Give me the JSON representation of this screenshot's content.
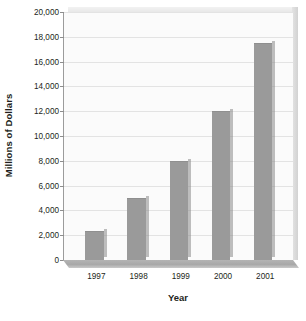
{
  "chart_data": {
    "type": "bar",
    "title": "",
    "subtitle": "",
    "xlabel": "Year",
    "ylabel": "Millions of Dollars",
    "categories": [
      "1997",
      "1998",
      "1999",
      "2000",
      "2001"
    ],
    "values": [
      2300,
      5000,
      8000,
      12000,
      17500
    ],
    "series": [
      {
        "name": "Millions of Dollars",
        "values": [
          2300,
          5000,
          8000,
          12000,
          17500
        ]
      }
    ],
    "ylim": [
      0,
      20000
    ],
    "ytick_step": 2000,
    "ytick_labels": [
      "20,000",
      "18,000",
      "16,000",
      "14,000",
      "12,000",
      "10,000",
      "8,000",
      "6,000",
      "4,000",
      "2,000",
      "0"
    ],
    "ytick_values": [
      20000,
      18000,
      16000,
      14000,
      12000,
      10000,
      8000,
      6000,
      4000,
      2000,
      0
    ],
    "grid": true,
    "grid_axis": "y",
    "legend": false,
    "legend_position": "none",
    "three_d": true,
    "colors": {
      "bar": "#9a9a9a",
      "bar_edge": "#8f8f8f",
      "plot_background": "#fbfbfb",
      "gridline": "#e3e3e3",
      "axis_line": "#8d8d8d",
      "floor": "#a8a8a8",
      "text": "#231f20"
    }
  }
}
